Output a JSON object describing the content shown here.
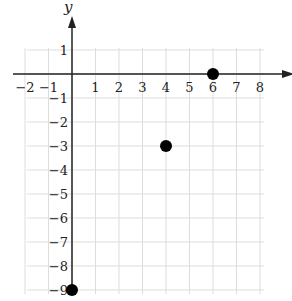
{
  "chart_data": {
    "type": "scatter",
    "title": "",
    "xlabel": "x",
    "ylabel": "y",
    "xlim": [
      -2,
      8
    ],
    "ylim": [
      -9,
      1
    ],
    "grid": true,
    "x_ticks": [
      "-2",
      "-1",
      "1",
      "2",
      "3",
      "4",
      "5",
      "6",
      "7",
      "8"
    ],
    "y_ticks": [
      "1",
      "-1",
      "-2",
      "-3",
      "-4",
      "-5",
      "-6",
      "-7",
      "-8",
      "-9"
    ],
    "points": [
      {
        "x": 0,
        "y": -9
      },
      {
        "x": 4,
        "y": -3
      },
      {
        "x": 6,
        "y": 0
      }
    ],
    "colors": {
      "points": "#000000",
      "grid": "#dddddd",
      "axes": "#222222"
    }
  }
}
